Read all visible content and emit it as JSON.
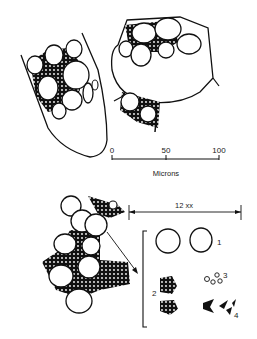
{
  "figure": {
    "type": "scientific-line-drawing",
    "colors": {
      "ink": "#111111",
      "background": "#ffffff"
    }
  },
  "scale_bar": {
    "ticks": [
      "0",
      "50",
      "100"
    ],
    "unit_label": "Microns"
  },
  "magnification": {
    "label": "12 xx"
  },
  "component_labels": [
    "1",
    "2",
    "3",
    "4"
  ]
}
